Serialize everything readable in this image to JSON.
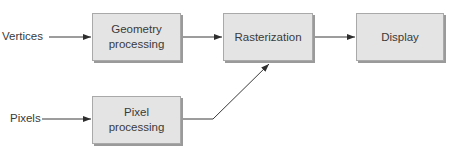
{
  "diagram": {
    "type": "flowchart",
    "inputs": {
      "vertices": "Vertices",
      "pixels": "Pixels"
    },
    "boxes": {
      "geometry": "Geometry\nprocessing",
      "geometry_line1": "Geometry",
      "geometry_line2": "processing",
      "pixel": "Pixel\nprocessing",
      "pixel_line1": "Pixel",
      "pixel_line2": "processing",
      "rasterization": "Rasterization",
      "display": "Display"
    },
    "edges": [
      {
        "from": "Vertices",
        "to": "Geometry processing"
      },
      {
        "from": "Geometry processing",
        "to": "Rasterization"
      },
      {
        "from": "Rasterization",
        "to": "Display"
      },
      {
        "from": "Pixels",
        "to": "Pixel processing"
      },
      {
        "from": "Pixel processing",
        "to": "Rasterization"
      }
    ],
    "colors": {
      "box_fill": "#e4e4e4",
      "box_border": "#a9a9a9",
      "line": "#3a3a3a",
      "text": "#3a3a3a"
    }
  }
}
